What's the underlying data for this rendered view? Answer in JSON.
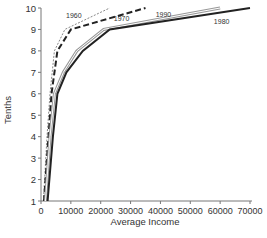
{
  "chart_data": {
    "type": "line",
    "title": "",
    "xlabel": "Average Income",
    "ylabel": "Tenths",
    "xlim": [
      0,
      70000
    ],
    "ylim": [
      1,
      10
    ],
    "x_ticks": [
      0,
      10000,
      20000,
      30000,
      40000,
      50000,
      60000,
      70000
    ],
    "x_tick_labels": [
      "0",
      "10000",
      "20000",
      "30000",
      "40000",
      "50000",
      "60000",
      "70000"
    ],
    "y_ticks": [
      1,
      2,
      3,
      4,
      5,
      6,
      7,
      8,
      9,
      10
    ],
    "y_tick_labels": [
      "1",
      "2",
      "3",
      "4",
      "5",
      "6",
      "7",
      "8",
      "9",
      "10"
    ],
    "grid": false,
    "legend": "inline labels",
    "series": [
      {
        "name": "1960",
        "style": "dotted",
        "color": "#888888",
        "points": [
          [
            800,
            1
          ],
          [
            2000,
            4
          ],
          [
            3000,
            6
          ],
          [
            4500,
            8
          ],
          [
            8000,
            9
          ],
          [
            23000,
            10
          ]
        ],
        "label_pos": [
          11000,
          9.55
        ]
      },
      {
        "name": "1970",
        "style": "dashed",
        "color": "#222222",
        "points": [
          [
            1000,
            1
          ],
          [
            2500,
            4
          ],
          [
            3500,
            6
          ],
          [
            5500,
            8
          ],
          [
            10000,
            9
          ],
          [
            35000,
            10
          ]
        ],
        "label_pos": [
          27000,
          9.4
        ]
      },
      {
        "name": "1990",
        "style": "double",
        "color": "#999999",
        "points": [
          [
            1500,
            1
          ],
          [
            3000,
            4
          ],
          [
            4500,
            6
          ],
          [
            7500,
            7
          ],
          [
            12000,
            8
          ],
          [
            21000,
            9
          ],
          [
            60000,
            10
          ]
        ],
        "label_pos": [
          41000,
          9.6
        ]
      },
      {
        "name": "1980",
        "style": "solid",
        "color": "#222222",
        "points": [
          [
            2200,
            1
          ],
          [
            4000,
            4
          ],
          [
            5500,
            6
          ],
          [
            8500,
            7
          ],
          [
            14000,
            8
          ],
          [
            23000,
            9
          ],
          [
            70000,
            10
          ]
        ],
        "label_pos": [
          60500,
          9.25
        ]
      }
    ]
  }
}
